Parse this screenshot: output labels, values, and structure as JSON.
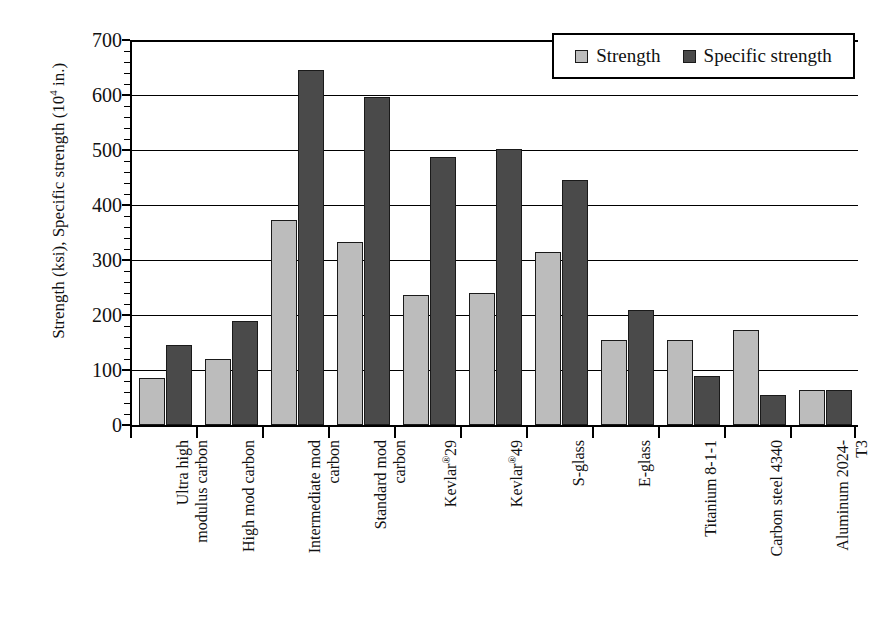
{
  "chart_data": {
    "type": "bar",
    "title": "",
    "xlabel": "",
    "ylabel": "Strength (ksi), Specific strength (10^4 in.)",
    "ylabel_main": "Strength (ksi), Specific strength (10",
    "ylabel_exp": "4",
    "ylabel_tail": " in.)",
    "ylim": [
      0,
      700
    ],
    "ytick_step": 100,
    "yminor_step": 20,
    "grid": true,
    "legend_position": "top-right",
    "ytick_labels": [
      "700",
      "600",
      "500",
      "400",
      "300",
      "200",
      "100",
      "0"
    ],
    "ytick_values": [
      700,
      600,
      500,
      400,
      300,
      200,
      100,
      0
    ],
    "categories": [
      "Ultra high\nmodulus carbon",
      "High mod carbon",
      "Intermediate mod\ncarbon",
      "Standard mod\ncarbon",
      "Kevlar®29",
      "Kevlar®49",
      "S-glass",
      "E-glass",
      "Titanium 8-1-1",
      "Carbon steel 4340",
      "Aluminum 2024-\nT3"
    ],
    "series": [
      {
        "name": "Strength",
        "color": "#bcbcbc",
        "values": [
          85,
          120,
          373,
          332,
          236,
          240,
          315,
          155,
          155,
          173,
          64
        ]
      },
      {
        "name": "Specific strength",
        "color": "#4a4a4a",
        "values": [
          145,
          190,
          645,
          597,
          488,
          501,
          445,
          209,
          90,
          55,
          64
        ]
      }
    ]
  },
  "legend": {
    "items": [
      {
        "label": "Strength",
        "swatch": "light-gray-swatch"
      },
      {
        "label": "Specific strength",
        "swatch": "dark-gray-swatch"
      }
    ]
  },
  "colors": {
    "series_strength": "#bcbcbc",
    "series_specific_strength": "#4a4a4a",
    "axis": "#000000",
    "background": "#ffffff"
  }
}
